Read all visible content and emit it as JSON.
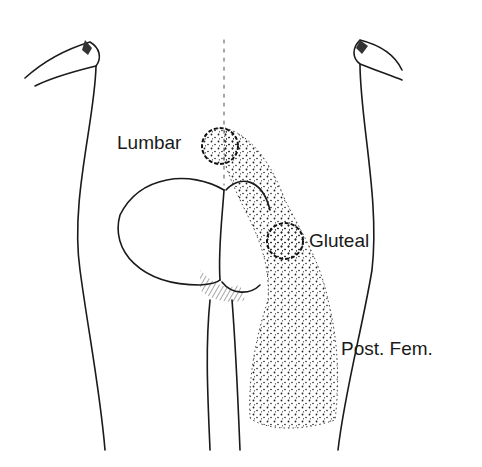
{
  "figure": {
    "labels": {
      "lumbar": "Lumbar",
      "gluteal": "Gluteal",
      "post_fem": "Post. Fem."
    },
    "colors": {
      "ink": "#1a1a1a",
      "background": "#ffffff"
    }
  }
}
